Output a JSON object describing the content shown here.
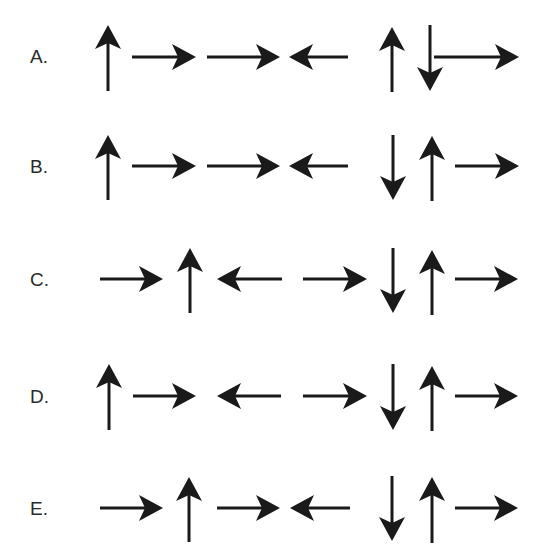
{
  "options": [
    {
      "label": "A.",
      "label_pos": [
        30,
        47
      ],
      "center_y": 57,
      "arrows": [
        {
          "dir": "up",
          "x": 108,
          "y1": 25,
          "y2": 91
        },
        {
          "dir": "right",
          "y": 57,
          "x1": 132,
          "x2": 196
        },
        {
          "dir": "right",
          "y": 57,
          "x1": 207,
          "x2": 280
        },
        {
          "dir": "left",
          "y": 57,
          "x1": 289,
          "x2": 348
        },
        {
          "dir": "up",
          "x": 392,
          "y1": 27,
          "y2": 92
        },
        {
          "dir": "down",
          "x": 430,
          "y1": 25,
          "y2": 91
        },
        {
          "dir": "right",
          "y": 57,
          "x1": 434,
          "x2": 519
        }
      ],
      "sequence": [
        "up",
        "right",
        "right",
        "left",
        "up",
        "down",
        "right"
      ]
    },
    {
      "label": "B.",
      "label_pos": [
        30,
        157
      ],
      "center_y": 166,
      "arrows": [
        {
          "dir": "up",
          "x": 108,
          "y1": 135,
          "y2": 200
        },
        {
          "dir": "right",
          "y": 166,
          "x1": 132,
          "x2": 196
        },
        {
          "dir": "right",
          "y": 166,
          "x1": 207,
          "x2": 280
        },
        {
          "dir": "left",
          "y": 166,
          "x1": 289,
          "x2": 348
        },
        {
          "dir": "down",
          "x": 393,
          "y1": 135,
          "y2": 200
        },
        {
          "dir": "up",
          "x": 432,
          "y1": 136,
          "y2": 201
        },
        {
          "dir": "right",
          "y": 166,
          "x1": 455,
          "x2": 519
        }
      ],
      "sequence": [
        "up",
        "right",
        "right",
        "left",
        "down",
        "up",
        "right"
      ]
    },
    {
      "label": "C.",
      "label_pos": [
        30,
        270
      ],
      "center_y": 279,
      "arrows": [
        {
          "dir": "right",
          "y": 279,
          "x1": 100,
          "x2": 163
        },
        {
          "dir": "up",
          "x": 190,
          "y1": 248,
          "y2": 313
        },
        {
          "dir": "left",
          "y": 279,
          "x1": 217,
          "x2": 282
        },
        {
          "dir": "right",
          "y": 279,
          "x1": 303,
          "x2": 367
        },
        {
          "dir": "down",
          "x": 393,
          "y1": 248,
          "y2": 313
        },
        {
          "dir": "up",
          "x": 432,
          "y1": 250,
          "y2": 315
        },
        {
          "dir": "right",
          "y": 279,
          "x1": 455,
          "x2": 518
        }
      ],
      "sequence": [
        "right",
        "up",
        "left",
        "right",
        "down",
        "up",
        "right"
      ]
    },
    {
      "label": "D.",
      "label_pos": [
        30,
        387
      ],
      "center_y": 396,
      "arrows": [
        {
          "dir": "up",
          "x": 109,
          "y1": 364,
          "y2": 430
        },
        {
          "dir": "right",
          "y": 396,
          "x1": 133,
          "x2": 196
        },
        {
          "dir": "left",
          "y": 396,
          "x1": 217,
          "x2": 281
        },
        {
          "dir": "right",
          "y": 396,
          "x1": 303,
          "x2": 367
        },
        {
          "dir": "down",
          "x": 393,
          "y1": 364,
          "y2": 430
        },
        {
          "dir": "up",
          "x": 432,
          "y1": 366,
          "y2": 431
        },
        {
          "dir": "right",
          "y": 396,
          "x1": 455,
          "x2": 518
        }
      ],
      "sequence": [
        "up",
        "right",
        "left",
        "right",
        "down",
        "up",
        "right"
      ]
    },
    {
      "label": "E.",
      "label_pos": [
        30,
        499
      ],
      "center_y": 508,
      "arrows": [
        {
          "dir": "right",
          "y": 508,
          "x1": 100,
          "x2": 163
        },
        {
          "dir": "up",
          "x": 189,
          "y1": 477,
          "y2": 542
        },
        {
          "dir": "right",
          "y": 508,
          "x1": 217,
          "x2": 280
        },
        {
          "dir": "left",
          "y": 508,
          "x1": 290,
          "x2": 350
        },
        {
          "dir": "down",
          "x": 392,
          "y1": 476,
          "y2": 541
        },
        {
          "dir": "up",
          "x": 432,
          "y1": 477,
          "y2": 543
        },
        {
          "dir": "right",
          "y": 508,
          "x1": 455,
          "x2": 518
        }
      ],
      "sequence": [
        "right",
        "up",
        "right",
        "left",
        "down",
        "up",
        "right"
      ]
    }
  ],
  "style": {
    "arrow_color": "#1a1a1a",
    "label_color": "#2a2a2a",
    "shaft_width": 3,
    "head_length": 24,
    "head_half_width": 13,
    "head_notch": 6
  }
}
